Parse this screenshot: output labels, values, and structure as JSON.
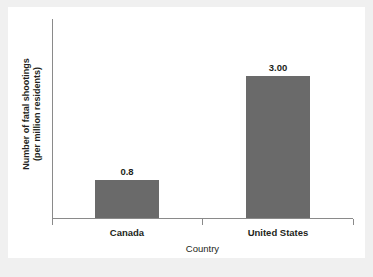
{
  "chart_data": {
    "type": "bar",
    "title": "",
    "categories": [
      "Canada",
      "United States"
    ],
    "values": [
      0.8,
      3.0
    ],
    "value_labels": [
      "0.8",
      "3.00"
    ],
    "xlabel": "Country",
    "ylabel": "Number of fatal shootings (per million residents)",
    "ylabel_line1": "Number of fatal shootings",
    "ylabel_line2": "(per million residents)",
    "ylim": [
      0,
      4.2
    ],
    "y_tick_labels": [],
    "grid": false,
    "legend": false,
    "legend_position": "none",
    "bar_color": "#6a6a6a",
    "axis_color": "#8a8a8a",
    "text_color": "#231f20",
    "background_color": "#ffffff",
    "page_background_color": "#f0f0f0"
  },
  "axis": {
    "x_title": "Country",
    "y_title_line1": "Number of fatal shootings",
    "y_title_line2": "(per million residents)"
  },
  "bars": [
    {
      "category": "Canada",
      "value": 0.8,
      "label": "0.8"
    },
    {
      "category": "United States",
      "value": 3.0,
      "label": "3.00"
    }
  ]
}
